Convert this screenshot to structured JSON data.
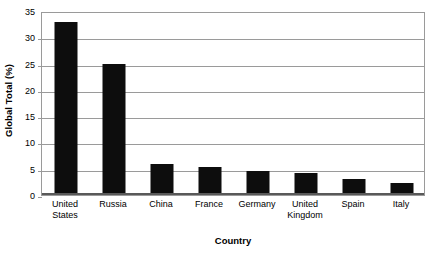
{
  "chart_data": {
    "type": "bar",
    "title": "",
    "xlabel": "Country",
    "ylabel": "Global Total (%)",
    "categories": [
      "United States",
      "Russia",
      "China",
      "France",
      "Germany",
      "United Kingdom",
      "Spain",
      "Italy"
    ],
    "values": [
      33,
      25,
      5.9,
      5.4,
      4.6,
      4.2,
      3.1,
      2.2
    ],
    "ylim": [
      0,
      35
    ],
    "ytick_labels": [
      "0",
      "5",
      "10",
      "15",
      "20",
      "25",
      "30",
      "35"
    ],
    "ytick_values": [
      0,
      5,
      10,
      15,
      20,
      25,
      30,
      35
    ],
    "grid": true,
    "legend": "none",
    "bar_color": "#0d0d0d",
    "grid_color": "#9a9a9a",
    "axis_color": "#595959",
    "background_color": "#ffffff"
  }
}
